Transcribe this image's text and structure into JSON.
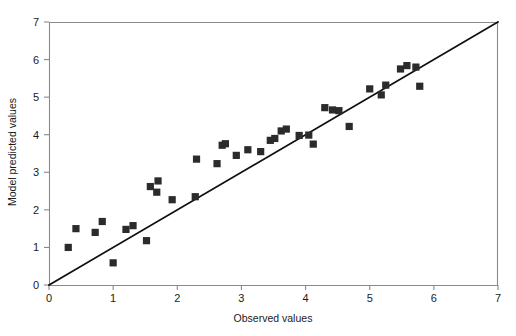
{
  "chart_data": {
    "type": "scatter",
    "title": "",
    "xlabel": "Observed values",
    "ylabel": "Model predicted values",
    "xlim": [
      0,
      7
    ],
    "ylim": [
      0,
      7
    ],
    "xticks": [
      0,
      1,
      2,
      3,
      4,
      5,
      6,
      7
    ],
    "yticks": [
      0,
      1,
      2,
      3,
      4,
      5,
      6,
      7
    ],
    "xticklabels": [
      "0",
      "1",
      "2",
      "3",
      "4",
      "5",
      "6",
      "7"
    ],
    "yticklabels": [
      "0",
      "1",
      "2",
      "3",
      "4",
      "5",
      "6",
      "7"
    ],
    "grid": false,
    "legend": null,
    "marker": "square",
    "marker_color": "#2b2b2b",
    "series": [
      {
        "name": "Model vs observed",
        "points": [
          [
            0.3,
            1.0
          ],
          [
            0.42,
            1.5
          ],
          [
            0.72,
            1.4
          ],
          [
            0.83,
            1.69
          ],
          [
            1.0,
            0.59
          ],
          [
            1.2,
            1.48
          ],
          [
            1.31,
            1.58
          ],
          [
            1.52,
            1.18
          ],
          [
            1.58,
            2.62
          ],
          [
            1.68,
            2.47
          ],
          [
            1.7,
            2.77
          ],
          [
            1.92,
            2.27
          ],
          [
            2.28,
            2.35
          ],
          [
            2.3,
            3.35
          ],
          [
            2.62,
            3.23
          ],
          [
            2.7,
            3.72
          ],
          [
            2.75,
            3.76
          ],
          [
            2.92,
            3.45
          ],
          [
            3.1,
            3.6
          ],
          [
            3.3,
            3.55
          ],
          [
            3.45,
            3.85
          ],
          [
            3.52,
            3.9
          ],
          [
            3.62,
            4.1
          ],
          [
            3.7,
            4.15
          ],
          [
            3.9,
            3.98
          ],
          [
            4.05,
            3.99
          ],
          [
            4.12,
            3.75
          ],
          [
            4.3,
            4.72
          ],
          [
            4.42,
            4.66
          ],
          [
            4.52,
            4.64
          ],
          [
            4.68,
            4.22
          ],
          [
            5.0,
            5.22
          ],
          [
            5.18,
            5.06
          ],
          [
            5.25,
            5.32
          ],
          [
            5.48,
            5.75
          ],
          [
            5.58,
            5.84
          ],
          [
            5.72,
            5.8
          ],
          [
            5.78,
            5.29
          ]
        ]
      }
    ],
    "reference_line": {
      "name": "1:1 identity line",
      "from": [
        0,
        0
      ],
      "to": [
        7,
        7
      ]
    }
  }
}
